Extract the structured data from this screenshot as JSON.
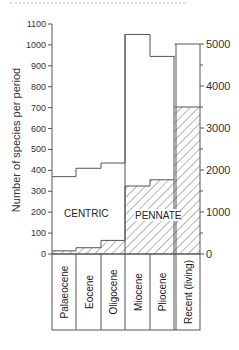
{
  "chart_data": {
    "type": "bar",
    "subtype": "stacked-step",
    "title": "",
    "ylabel": "Number of species per period",
    "xlabel": "",
    "categories": [
      "Palaeocene",
      "Eocene",
      "Oligocene",
      "Miocene",
      "Pliocene",
      "Recent (living)"
    ],
    "series": [
      {
        "name": "PENNATE",
        "hatched": true,
        "values": [
          15,
          30,
          65,
          325,
          355,
          3500
        ]
      },
      {
        "name": "CENTRIC",
        "hatched": false,
        "values": [
          355,
          380,
          370,
          725,
          590,
          1500
        ]
      }
    ],
    "totals": [
      370,
      410,
      435,
      1050,
      945,
      5000
    ],
    "left_axis": {
      "ylim": [
        0,
        1100
      ],
      "ticks": [
        0,
        100,
        200,
        300,
        400,
        500,
        600,
        700,
        800,
        900,
        1000,
        1100
      ],
      "applies_to": [
        "Palaeocene",
        "Eocene",
        "Oligocene",
        "Miocene",
        "Pliocene"
      ]
    },
    "right_axis": {
      "ylim": [
        0,
        5000
      ],
      "ticks": [
        0,
        1000,
        2000,
        3000,
        4000,
        5000
      ],
      "applies_to": [
        "Recent (living)"
      ]
    },
    "annotations": [
      "CENTRIC",
      "PENNATE"
    ],
    "grid": false,
    "legend": "none (inline labels)"
  },
  "labels": {
    "ylabel": "Number of species per period",
    "centric": "CENTRIC",
    "pennate": "PENNATE",
    "periods": [
      "Palaeocene",
      "Eocene",
      "Oligocene",
      "Miocene",
      "Pliocene",
      "Recent (living)"
    ],
    "left_ticks": [
      "0",
      "100",
      "200",
      "300",
      "400",
      "500",
      "600",
      "700",
      "800",
      "900",
      "1000",
      "1100"
    ],
    "right_ticks": [
      "0",
      "1000",
      "2000",
      "3000",
      "4000",
      "5000"
    ]
  }
}
